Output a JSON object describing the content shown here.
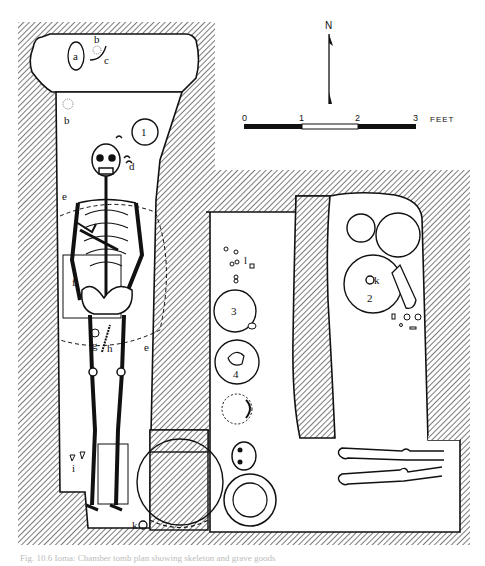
{
  "figure": {
    "type": "archaeological burial plan",
    "caption": "Fig. 10.6 Ioma: Chamber tomb plan showing skeleton and grave goods"
  },
  "north_arrow": {
    "label": "N"
  },
  "scale_bar": {
    "ticks": [
      "0",
      "1",
      "2",
      "3"
    ],
    "unit": "FEET"
  },
  "labels": {
    "a": "a",
    "b_top": "b",
    "c": "c",
    "b_left": "b",
    "d": "d",
    "e_top": "e",
    "e_bottom": "e",
    "f": "f",
    "g": "g",
    "h": "h",
    "i": "i",
    "k_bottom": "k",
    "k_vessel": "k",
    "l": "l",
    "vessel_1": "1",
    "vessel_2": "2",
    "vessel_3": "3",
    "vessel_4": "4"
  },
  "colors": {
    "ink": "#111111",
    "hatch": "#333333",
    "background": "#ffffff"
  }
}
